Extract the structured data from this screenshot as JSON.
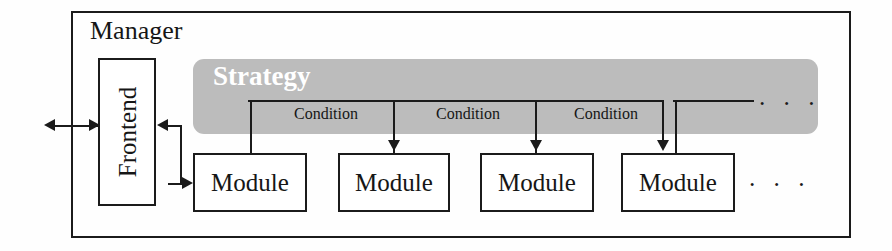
{
  "diagram": {
    "colors": {
      "line": "#1b1b1b",
      "strategy_fill": "#bcbcbc",
      "strategy_text": "#ffffff",
      "box_fill": "#ffffff",
      "page_background": "#ffffff"
    },
    "manager": {
      "label": "Manager"
    },
    "frontend": {
      "label": "Frontend"
    },
    "strategy": {
      "label": "Strategy",
      "ellipsis": "· · ·"
    },
    "modules": [
      {
        "label": "Module"
      },
      {
        "label": "Module"
      },
      {
        "label": "Module"
      },
      {
        "label": "Module"
      }
    ],
    "modules_ellipsis": "· · ·",
    "conditions": [
      {
        "label": "Condition"
      },
      {
        "label": "Condition"
      },
      {
        "label": "Condition"
      }
    ],
    "external_arrow": {
      "name": "bidirectional-external-link"
    }
  }
}
